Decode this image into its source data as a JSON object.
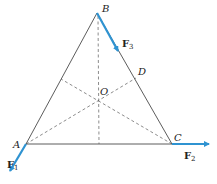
{
  "diagram": {
    "type": "equilateral-triangle-force-diagram",
    "colors": {
      "force_arrow": "#2f93d1",
      "triangle_edge": "#4a4a4a",
      "dashed_line": "#5a5a5a"
    },
    "points": {
      "A": {
        "label": "A"
      },
      "B": {
        "label": "B"
      },
      "C": {
        "label": "C"
      },
      "D": {
        "label": "D"
      },
      "O": {
        "label": "O"
      }
    },
    "forces": [
      {
        "id": "F1",
        "label": "F",
        "subscript": "1",
        "at": "A",
        "direction": "down-left"
      },
      {
        "id": "F2",
        "label": "F",
        "subscript": "2",
        "at": "C",
        "direction": "right"
      },
      {
        "id": "F3",
        "label": "F",
        "subscript": "3",
        "at": "B",
        "direction": "along BC"
      }
    ]
  }
}
